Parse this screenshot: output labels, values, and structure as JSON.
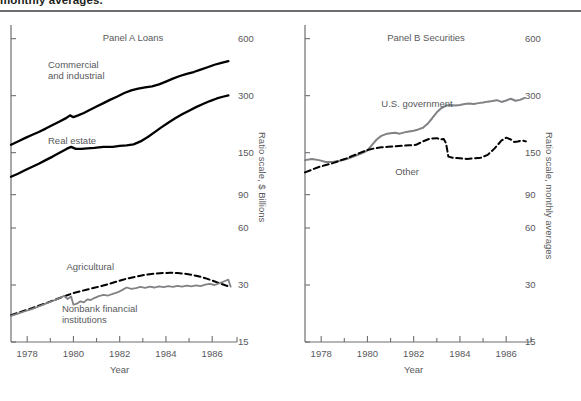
{
  "header": {
    "title": "monthly averages."
  },
  "chart_data": [
    {
      "id": "panel-a",
      "type": "line",
      "title": "Panel A Loans",
      "xlabel": "Year",
      "ylabel": "Ratio scale, $ Billions",
      "scale": "log",
      "xlim": [
        1977.3,
        1986.9
      ],
      "ylim": [
        15,
        700
      ],
      "xticks": [
        1978,
        1980,
        1982,
        1984,
        1986
      ],
      "xtick_labels": [
        "1978",
        "1980",
        "1982",
        "1984",
        "1986"
      ],
      "xminor_ticks": [
        1979,
        1981,
        1983,
        1985
      ],
      "yticks": [
        15,
        30,
        60,
        90,
        150,
        300,
        600
      ],
      "ytick_labels": [
        "15",
        "30",
        "60",
        "90",
        "150",
        "300",
        "600"
      ],
      "grid": false,
      "legend": "inline-annotations",
      "series": [
        {
          "name": "Commercial and industrial",
          "style": "solid",
          "color": "#000000",
          "width": 2.3,
          "label_pos": [
            1978.9,
            470
          ],
          "x": [
            1977.3,
            1977.6,
            1977.9,
            1978.2,
            1978.5,
            1978.8,
            1979.1,
            1979.4,
            1979.7,
            1979.85,
            1980.0,
            1980.2,
            1980.45,
            1980.7,
            1981.0,
            1981.3,
            1981.6,
            1981.9,
            1982.2,
            1982.5,
            1982.8,
            1983.1,
            1983.4,
            1983.7,
            1984.0,
            1984.3,
            1984.6,
            1984.9,
            1985.2,
            1985.5,
            1985.8,
            1986.1,
            1986.4,
            1986.7
          ],
          "y": [
            165,
            172,
            179,
            186,
            193,
            201,
            210,
            219,
            229,
            236,
            231,
            236,
            243,
            252,
            263,
            274,
            286,
            297,
            310,
            320,
            327,
            332,
            336,
            344,
            356,
            369,
            381,
            391,
            400,
            412,
            424,
            437,
            447,
            456
          ]
        },
        {
          "name": "Real estate",
          "style": "solid",
          "color": "#000000",
          "width": 2.3,
          "label_pos": [
            1978.9,
            185
          ],
          "x": [
            1977.3,
            1977.6,
            1977.9,
            1978.2,
            1978.5,
            1978.8,
            1979.1,
            1979.4,
            1979.7,
            1979.9,
            1980.1,
            1980.35,
            1980.6,
            1980.9,
            1981.3,
            1981.7,
            1982.0,
            1982.3,
            1982.6,
            1982.9,
            1983.2,
            1983.5,
            1983.8,
            1984.1,
            1984.4,
            1984.7,
            1985.0,
            1985.3,
            1985.6,
            1985.9,
            1986.2,
            1986.5,
            1986.7
          ],
          "y": [
            112,
            116,
            121,
            126,
            131,
            137,
            143,
            150,
            157,
            161,
            157,
            157,
            158,
            159,
            161,
            161,
            163,
            164,
            166,
            172,
            181,
            192,
            204,
            216,
            228,
            239,
            250,
            261,
            271,
            281,
            290,
            297,
            301
          ]
        },
        {
          "name": "Agricultural",
          "style": "dashed",
          "color": "#000000",
          "width": 2.0,
          "label_pos": [
            1979.7,
            40
          ],
          "x": [
            1977.3,
            1977.6,
            1977.9,
            1978.2,
            1978.5,
            1978.8,
            1979.1,
            1979.4,
            1979.7,
            1980.0,
            1980.3,
            1980.6,
            1980.9,
            1981.2,
            1981.5,
            1981.8,
            1982.1,
            1982.4,
            1982.7,
            1983.0,
            1983.3,
            1983.6,
            1983.9,
            1984.2,
            1984.5,
            1984.8,
            1985.1,
            1985.4,
            1985.7,
            1986.0,
            1986.3,
            1986.6,
            1986.8
          ],
          "y": [
            20.8,
            21.4,
            22.0,
            22.6,
            23.3,
            24.0,
            24.8,
            25.6,
            26.4,
            27.2,
            27.8,
            28.4,
            29.0,
            29.6,
            30.3,
            31.1,
            31.9,
            32.6,
            33.2,
            33.8,
            34.2,
            34.5,
            34.7,
            34.8,
            34.7,
            34.4,
            34.0,
            33.4,
            32.6,
            31.7,
            30.7,
            29.8,
            29.3
          ]
        },
        {
          "name": "Nonbank financial institutions",
          "style": "solid",
          "color": "#808285",
          "width": 1.8,
          "label_pos": [
            1979.5,
            24.2
          ],
          "x": [
            1977.3,
            1977.6,
            1977.9,
            1978.2,
            1978.5,
            1978.8,
            1979.1,
            1979.4,
            1979.6,
            1979.75,
            1979.9,
            1980.0,
            1980.15,
            1980.3,
            1980.45,
            1980.6,
            1980.75,
            1980.9,
            1981.1,
            1981.3,
            1981.5,
            1981.7,
            1981.9,
            1982.1,
            1982.3,
            1982.5,
            1982.7,
            1982.9,
            1983.1,
            1983.3,
            1983.5,
            1983.7,
            1983.9,
            1984.1,
            1984.3,
            1984.5,
            1984.7,
            1984.9,
            1985.1,
            1985.3,
            1985.5,
            1985.7,
            1985.9,
            1986.1,
            1986.3,
            1986.5,
            1986.7,
            1986.8
          ],
          "y": [
            20.6,
            21.2,
            21.8,
            22.4,
            23.1,
            23.9,
            24.7,
            25.6,
            26.3,
            25.3,
            26.1,
            23.6,
            23.9,
            24.6,
            24.3,
            25.2,
            25.0,
            25.6,
            26.2,
            26.6,
            26.4,
            26.9,
            27.4,
            28.2,
            29.1,
            28.6,
            28.9,
            29.3,
            29.0,
            29.4,
            29.1,
            29.5,
            29.2,
            29.6,
            29.3,
            29.7,
            29.4,
            29.8,
            29.5,
            29.9,
            29.6,
            30.1,
            30.4,
            30.0,
            30.6,
            31.3,
            32.0,
            29.4
          ]
        }
      ]
    },
    {
      "id": "panel-b",
      "type": "line",
      "title": "Panel B Securities",
      "xlabel": "Year",
      "ylabel": "Ratio scale, monthly averages",
      "scale": "log",
      "xlim": [
        1977.3,
        1986.9
      ],
      "ylim": [
        15,
        700
      ],
      "xticks": [
        1978,
        1980,
        1982,
        1984,
        1986
      ],
      "xtick_labels": [
        "1978",
        "1980",
        "1982",
        "1984",
        "1986"
      ],
      "xminor_ticks": [
        1979,
        1981,
        1983,
        1985
      ],
      "yticks": [
        15,
        30,
        60,
        90,
        150,
        300,
        600
      ],
      "ytick_labels": [
        "15",
        "30",
        "60",
        "90",
        "150",
        "300",
        "600"
      ],
      "grid": false,
      "legend": "inline-annotations",
      "series": [
        {
          "name": "U.S. government",
          "style": "solid",
          "color": "#808285",
          "width": 2.0,
          "label_pos": [
            1980.6,
            290
          ],
          "x": [
            1977.3,
            1977.6,
            1977.9,
            1978.2,
            1978.5,
            1978.8,
            1979.1,
            1979.4,
            1979.7,
            1980.0,
            1980.2,
            1980.4,
            1980.6,
            1980.8,
            1981.0,
            1981.2,
            1981.4,
            1981.6,
            1981.8,
            1982.0,
            1982.2,
            1982.4,
            1982.6,
            1982.8,
            1983.0,
            1983.2,
            1983.4,
            1983.6,
            1983.8,
            1984.0,
            1984.2,
            1984.4,
            1984.6,
            1984.8,
            1985.0,
            1985.2,
            1985.4,
            1985.6,
            1985.8,
            1986.0,
            1986.2,
            1986.4,
            1986.6,
            1986.8
          ],
          "y": [
            137,
            139,
            137,
            134,
            134,
            136,
            139,
            143,
            148,
            154,
            165,
            176,
            184,
            188,
            190,
            191,
            189,
            192,
            194,
            196,
            199,
            203,
            213,
            228,
            245,
            258,
            266,
            268,
            266,
            268,
            271,
            273,
            271,
            274,
            276,
            279,
            281,
            284,
            278,
            283,
            289,
            282,
            285,
            292
          ]
        },
        {
          "name": "Other",
          "style": "dashed",
          "color": "#000000",
          "width": 2.0,
          "label_pos": [
            1981.2,
            128
          ],
          "x": [
            1977.3,
            1977.6,
            1977.9,
            1978.2,
            1978.5,
            1978.8,
            1979.1,
            1979.4,
            1979.7,
            1980.0,
            1980.3,
            1980.6,
            1980.9,
            1981.2,
            1981.5,
            1981.8,
            1982.1,
            1982.4,
            1982.7,
            1983.0,
            1983.15,
            1983.3,
            1983.4,
            1983.5,
            1983.7,
            1984.0,
            1984.3,
            1984.6,
            1984.9,
            1985.2,
            1985.5,
            1985.8,
            1986.0,
            1986.2,
            1986.35,
            1986.5,
            1986.7,
            1986.85
          ],
          "y": [
            118,
            122,
            126,
            129,
            132,
            136,
            140,
            145,
            150,
            155,
            158,
            160,
            161,
            162,
            163,
            164,
            165,
            172,
            178,
            179,
            176,
            177,
            168,
            143,
            141,
            140,
            139,
            140,
            141,
            146,
            158,
            174,
            180,
            176,
            171,
            172,
            174,
            172
          ]
        }
      ]
    }
  ]
}
